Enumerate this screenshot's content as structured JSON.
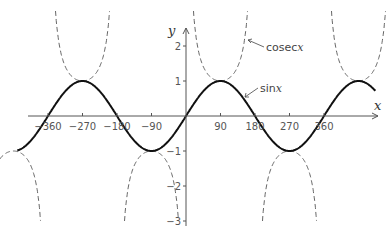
{
  "chart_data": {
    "type": "line",
    "title": "",
    "xlabel": "x",
    "ylabel": "y",
    "xlim": [
      -450,
      470
    ],
    "ylim": [
      -3,
      3
    ],
    "grid": false,
    "legend": null,
    "x_ticks": [
      -360,
      -270,
      -180,
      -90,
      90,
      180,
      270,
      360
    ],
    "x_tick_labels": [
      "−360",
      "−270",
      "−180",
      "−90",
      "90",
      "180",
      "270",
      "360"
    ],
    "y_ticks": [
      -3,
      -2,
      -1,
      1,
      2
    ],
    "y_tick_labels": [
      "−3",
      "−2",
      "−1",
      "1",
      "2"
    ],
    "series": [
      {
        "name": "sin x",
        "style": "solid",
        "color": "#111111",
        "x_range": [
          -440,
          495
        ],
        "x": [
          -450,
          -360,
          -270,
          -180,
          -90,
          0,
          90,
          180,
          270,
          360,
          450
        ],
        "values": [
          -1,
          0,
          1,
          0,
          -1,
          0,
          1,
          0,
          -1,
          0,
          1
        ]
      },
      {
        "name": "cosec x",
        "style": "dashed",
        "color": "#555555",
        "clip": [
          -3,
          3
        ],
        "asymptotes": [
          -360,
          -180,
          0,
          180,
          360
        ],
        "x": [
          -450,
          -270,
          -90,
          90,
          270,
          450
        ],
        "values": [
          -1,
          1,
          -1,
          1,
          -1,
          1
        ]
      }
    ],
    "annotations": [
      {
        "text": "cosec",
        "var": "x",
        "points_to": "cosec x"
      },
      {
        "text": "sin",
        "var": "x",
        "points_to": "sin x"
      }
    ]
  }
}
